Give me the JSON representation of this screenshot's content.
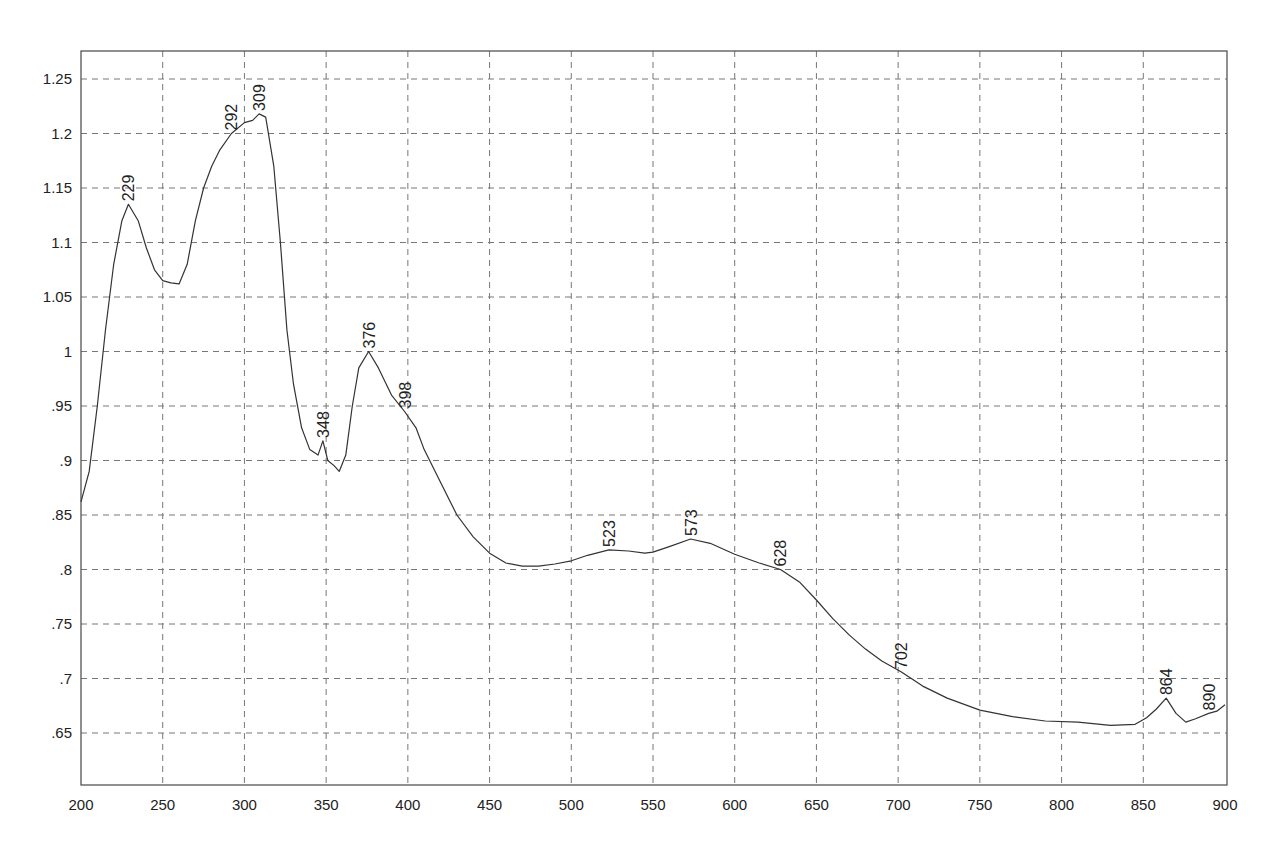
{
  "chart_data": {
    "type": "line",
    "title": "",
    "xlabel": "",
    "ylabel": "",
    "xlim": [
      200,
      900
    ],
    "ylim": [
      0.6,
      1.275
    ],
    "grid": true,
    "legend": null,
    "x_ticks": [
      200,
      250,
      300,
      350,
      400,
      450,
      500,
      550,
      600,
      650,
      700,
      750,
      800,
      850,
      900
    ],
    "x_tick_labels": [
      "200",
      "250",
      "300",
      "350",
      "400",
      "450",
      "500",
      "550",
      "600",
      "650",
      "700",
      "750",
      "800",
      "850",
      "900"
    ],
    "y_ticks": [
      1.25,
      1.2,
      1.15,
      1.1,
      1.05,
      1.0,
      0.95,
      0.9,
      0.85,
      0.8,
      0.75,
      0.7,
      0.65
    ],
    "y_tick_labels": [
      "1.25",
      "1.2",
      "1.15",
      "1.1",
      "1.05",
      "1",
      ".95",
      ".9",
      ".85",
      ".8",
      ".75",
      ".7",
      ".65"
    ],
    "series": [
      {
        "name": "spectrum",
        "color": "#333333",
        "x": [
          200,
          205,
          210,
          215,
          220,
          225,
          229,
          235,
          240,
          245,
          250,
          255,
          260,
          265,
          270,
          275,
          280,
          285,
          292,
          300,
          305,
          309,
          313,
          318,
          322,
          326,
          330,
          335,
          340,
          345,
          348,
          351,
          355,
          358,
          362,
          366,
          370,
          376,
          382,
          390,
          398,
          405,
          410,
          420,
          430,
          440,
          450,
          460,
          470,
          480,
          490,
          500,
          510,
          523,
          535,
          545,
          550,
          560,
          573,
          585,
          600,
          615,
          628,
          640,
          650,
          660,
          670,
          680,
          690,
          702,
          715,
          730,
          750,
          770,
          790,
          810,
          830,
          845,
          852,
          858,
          864,
          870,
          876,
          882,
          890,
          895,
          900
        ],
        "y": [
          0.862,
          0.89,
          0.95,
          1.02,
          1.08,
          1.12,
          1.135,
          1.12,
          1.095,
          1.075,
          1.065,
          1.063,
          1.062,
          1.08,
          1.12,
          1.15,
          1.17,
          1.185,
          1.2,
          1.21,
          1.212,
          1.218,
          1.215,
          1.17,
          1.1,
          1.02,
          0.97,
          0.93,
          0.91,
          0.905,
          0.918,
          0.9,
          0.895,
          0.89,
          0.905,
          0.95,
          0.985,
          1.0,
          0.985,
          0.96,
          0.945,
          0.93,
          0.91,
          0.88,
          0.85,
          0.83,
          0.815,
          0.806,
          0.803,
          0.803,
          0.805,
          0.808,
          0.813,
          0.818,
          0.817,
          0.815,
          0.816,
          0.821,
          0.828,
          0.824,
          0.814,
          0.806,
          0.8,
          0.788,
          0.772,
          0.755,
          0.74,
          0.727,
          0.716,
          0.706,
          0.693,
          0.682,
          0.671,
          0.665,
          0.661,
          0.66,
          0.657,
          0.658,
          0.664,
          0.672,
          0.682,
          0.668,
          0.66,
          0.663,
          0.668,
          0.67,
          0.676
        ]
      }
    ],
    "annotations": [
      {
        "label": "229",
        "x": 229,
        "y": 1.135
      },
      {
        "label": "292",
        "x": 292,
        "y": 1.2
      },
      {
        "label": "309",
        "x": 309,
        "y": 1.218
      },
      {
        "label": "348",
        "x": 348,
        "y": 0.918
      },
      {
        "label": "376",
        "x": 376,
        "y": 1.0
      },
      {
        "label": "398",
        "x": 398,
        "y": 0.945
      },
      {
        "label": "523",
        "x": 523,
        "y": 0.818
      },
      {
        "label": "573",
        "x": 573,
        "y": 0.828
      },
      {
        "label": "628",
        "x": 628,
        "y": 0.8
      },
      {
        "label": "702",
        "x": 702,
        "y": 0.706
      },
      {
        "label": "864",
        "x": 864,
        "y": 0.682
      },
      {
        "label": "890",
        "x": 890,
        "y": 0.668
      }
    ]
  },
  "style": {
    "line_color": "#333333",
    "grid_color": "#777777",
    "axis_color": "#555555",
    "background": "#ffffff"
  }
}
